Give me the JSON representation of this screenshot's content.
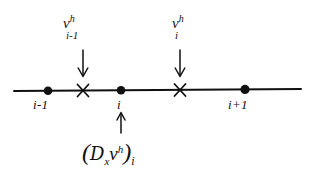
{
  "figure": {
    "background_color": "#ffffff",
    "ink_color": "#111111",
    "axis": {
      "y": 90,
      "x_start": 14,
      "x_end": 301,
      "stroke_width": 2
    },
    "nodes": [
      {
        "id": "node-i-minus-1",
        "label": "i-1",
        "x": 48,
        "marker": "filled-dot"
      },
      {
        "id": "node-i",
        "label": "i",
        "x": 121,
        "marker": "filled-dot"
      },
      {
        "id": "node-i-plus-1",
        "label": "i+1",
        "x": 245,
        "marker": "filled-dot"
      }
    ],
    "half_nodes": [
      {
        "id": "half-node-left",
        "x": 83,
        "marker": "x-cross"
      },
      {
        "id": "half-node-right",
        "x": 180,
        "marker": "x-cross"
      }
    ],
    "value_labels": [
      {
        "id": "value-label-left",
        "base": "v",
        "superscript": "h",
        "subscript": "i-1",
        "x": 63,
        "y": 16,
        "arrow": {
          "direction": "down",
          "x": 83,
          "y_start": 48,
          "y_end": 76
        }
      },
      {
        "id": "value-label-right",
        "base": "v",
        "superscript": "h",
        "subscript": "i",
        "x": 172,
        "y": 16,
        "arrow": {
          "direction": "down",
          "x": 180,
          "y_start": 48,
          "y_end": 76
        }
      }
    ],
    "operator_label": {
      "id": "operator-expression",
      "open_paren": "(",
      "operator": "D",
      "operator_subscript": "x",
      "operand": "v",
      "operand_superscript": "h",
      "close_paren": ")",
      "outer_subscript": "i",
      "x": 82,
      "y": 140,
      "arrow": {
        "direction": "up",
        "x": 121,
        "y_start": 134,
        "y_end": 110
      }
    }
  }
}
